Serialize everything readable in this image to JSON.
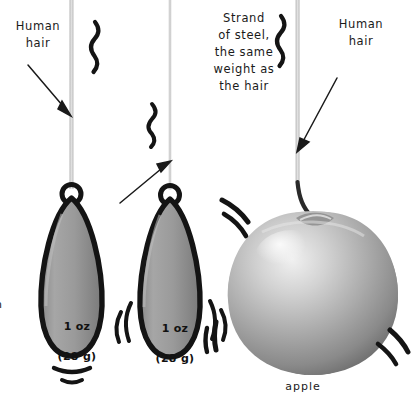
{
  "figure": {
    "background_color": "#ffffff",
    "ink_color": "#1a1a1a",
    "thread_color": "#c9c9c9"
  },
  "annotations": {
    "left_label": "Human\nhair",
    "middle_label": "Strand\nof steel,\nthe same\nweight as\nthe hair",
    "right_label": "Human\nhair",
    "apple_label": "apple",
    "clipped_left_text": "om"
  },
  "objects": [
    {
      "id": "pendulum-hair",
      "kind": "fishing-sinker-weight",
      "weight_line_1": "1 oz",
      "weight_line_2": "(28 g)",
      "suspended_by": "human hair",
      "motion_marks": 2
    },
    {
      "id": "pendulum-steel",
      "kind": "fishing-sinker-weight",
      "weight_line_1": "1 oz",
      "weight_line_2": "(28 g)",
      "suspended_by": "strand of steel",
      "motion_marks": 4
    },
    {
      "id": "apple",
      "kind": "apple",
      "suspended_by": "human hair",
      "motion_marks": 4
    }
  ],
  "icons": {
    "squiggle_left": "squiggle-icon",
    "squiggle_middle": "squiggle-icon",
    "squiggle_right": "squiggle-icon",
    "arrow_left": "arrow-icon",
    "arrow_middle": "arrow-icon",
    "arrow_right": "arrow-icon",
    "arrow_apple": "arrow-icon"
  },
  "colors": {
    "weight_body_light": "#9d9d9d",
    "weight_body_dark": "#6e6e6e",
    "weight_outline": "#141414",
    "apple_light": "#e6e6e6",
    "apple_mid": "#a8a8a8",
    "apple_dark": "#6a6a6a",
    "stem": "#2a2a2a"
  }
}
